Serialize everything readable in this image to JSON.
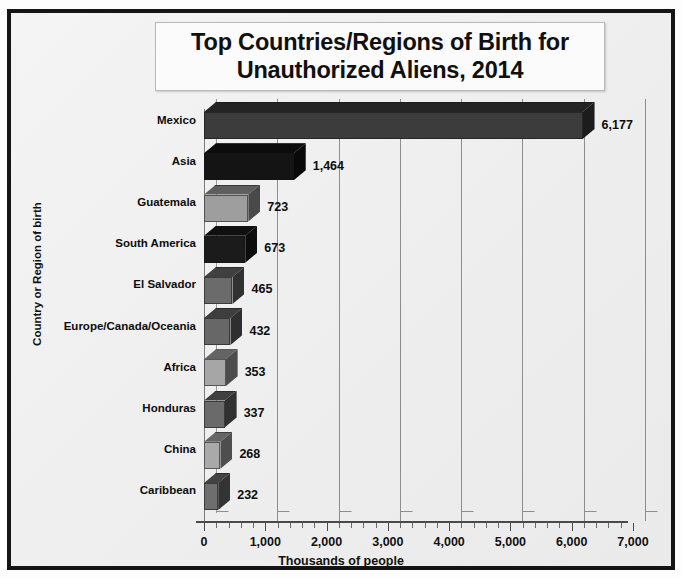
{
  "chart_data": {
    "type": "bar",
    "orientation": "horizontal",
    "title": "Top Countries/Regions of Birth for\nUnauthorized Aliens, 2014",
    "xlabel": "Thousands of people",
    "ylabel": "Country or Region of birth",
    "xlim": [
      0,
      7000
    ],
    "xticks": [
      "0",
      "1,000",
      "2,000",
      "3,000",
      "4,000",
      "5,000",
      "6,000",
      "7,000"
    ],
    "xtick_values": [
      0,
      1000,
      2000,
      3000,
      4000,
      5000,
      6000,
      7000
    ],
    "minor_tick_interval": 200,
    "grid": "vertical",
    "legend": "none",
    "style": "3d-bar",
    "categories": [
      "Caribbean",
      "China",
      "Honduras",
      "Africa",
      "Europe/Canada/Oceania",
      "El Salvador",
      "South America",
      "Guatemala",
      "Asia",
      "Mexico"
    ],
    "values": [
      232,
      268,
      337,
      353,
      432,
      465,
      673,
      723,
      1464,
      6177
    ],
    "value_labels": [
      "232",
      "268",
      "337",
      "353",
      "432",
      "465",
      "673",
      "723",
      "1,464",
      "6,177"
    ],
    "bar_colors": [
      "#6e6e6e",
      "#a9a9a9",
      "#6a6a6a",
      "#a6a6a6",
      "#676767",
      "#6b6b6b",
      "#1b1b1b",
      "#9e9e9e",
      "#141414",
      "#3c3c3c"
    ]
  },
  "colors": {
    "frame": "#151515",
    "plot_background": "#f0f0f0",
    "gridline": "#8d8d8d",
    "axis": "#4a4a4a",
    "text": "#101010",
    "title_box_background": "#fbfbfb",
    "title_box_border": "#b9b9b9"
  }
}
